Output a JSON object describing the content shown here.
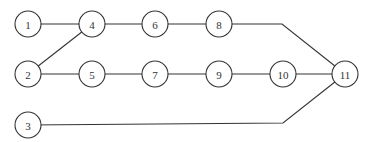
{
  "diagram": {
    "type": "network-graph",
    "style": {
      "stroke": "#333333",
      "background": "#ffffff",
      "node_radius": 13
    },
    "nodes": [
      {
        "id": "1",
        "label": "1",
        "x": 28,
        "y": 24
      },
      {
        "id": "2",
        "label": "2",
        "x": 28,
        "y": 74
      },
      {
        "id": "3",
        "label": "3",
        "x": 28,
        "y": 125
      },
      {
        "id": "4",
        "label": "4",
        "x": 92,
        "y": 24
      },
      {
        "id": "5",
        "label": "5",
        "x": 92,
        "y": 74
      },
      {
        "id": "6",
        "label": "6",
        "x": 155,
        "y": 24
      },
      {
        "id": "7",
        "label": "7",
        "x": 155,
        "y": 74
      },
      {
        "id": "8",
        "label": "8",
        "x": 219,
        "y": 24
      },
      {
        "id": "9",
        "label": "9",
        "x": 219,
        "y": 74
      },
      {
        "id": "10",
        "label": "10",
        "x": 283,
        "y": 74
      },
      {
        "id": "11",
        "label": "11",
        "x": 345,
        "y": 74
      }
    ],
    "edges": [
      {
        "from": "1",
        "to": "4"
      },
      {
        "from": "4",
        "to": "6"
      },
      {
        "from": "6",
        "to": "8"
      },
      {
        "from": "8",
        "to": "11",
        "via": [
          [
            282,
            24
          ]
        ]
      },
      {
        "from": "2",
        "to": "4"
      },
      {
        "from": "2",
        "to": "5"
      },
      {
        "from": "5",
        "to": "7"
      },
      {
        "from": "7",
        "to": "9"
      },
      {
        "from": "9",
        "to": "10"
      },
      {
        "from": "10",
        "to": "11"
      },
      {
        "from": "3",
        "to": "11",
        "via": [
          [
            283,
            123
          ]
        ]
      }
    ]
  }
}
